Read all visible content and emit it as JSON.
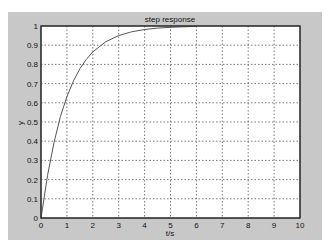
{
  "chart_data": {
    "type": "line",
    "title": "step response",
    "xlabel": "t/s",
    "ylabel": "y",
    "xlim": [
      0,
      10
    ],
    "ylim": [
      0,
      1
    ],
    "xticks": [
      "0",
      "1",
      "2",
      "3",
      "4",
      "5",
      "6",
      "7",
      "8",
      "9",
      "10"
    ],
    "yticks": [
      "0",
      "0.1",
      "0.2",
      "0.3",
      "0.4",
      "0.5",
      "0.6",
      "0.7",
      "0.8",
      "0.9",
      "1"
    ],
    "grid": true,
    "legend": null,
    "series": [
      {
        "name": "step response",
        "color": "#555555",
        "x": [
          0,
          0.25,
          0.5,
          0.75,
          1,
          1.25,
          1.5,
          1.75,
          2,
          2.5,
          3,
          3.5,
          4,
          4.5,
          5,
          5.5,
          6
        ],
        "y": [
          0,
          0.221,
          0.393,
          0.528,
          0.632,
          0.713,
          0.777,
          0.826,
          0.865,
          0.918,
          0.95,
          0.97,
          0.982,
          0.989,
          0.993,
          0.996,
          0.998
        ]
      }
    ]
  },
  "colors": {
    "figure_bg": "#c8c8c8",
    "axes_bg": "#ffffff",
    "grid": "#555555",
    "line": "#555555"
  }
}
